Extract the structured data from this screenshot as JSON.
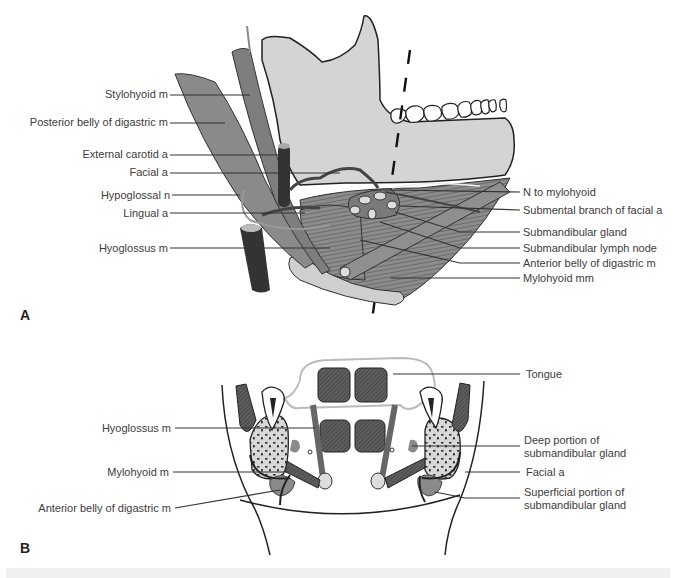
{
  "figure": {
    "panels": [
      {
        "id": "A",
        "letter": "A",
        "view": "lateral view of submandibular region",
        "labels_left": [
          {
            "text": "Stylohyoid m"
          },
          {
            "text": "Posterior belly of digastric m"
          },
          {
            "text": "External carotid a"
          },
          {
            "text": "Facial a"
          },
          {
            "text": "Hypoglossal n"
          },
          {
            "text": "Lingual a"
          },
          {
            "text": "Hyoglossus m"
          }
        ],
        "labels_right": [
          {
            "text": "N to mylohyoid"
          },
          {
            "text": "Submental branch of facial a"
          },
          {
            "text": "Submandibular gland"
          },
          {
            "text": "Submandibular lymph node"
          },
          {
            "text": "Anterior belly of digastric m"
          },
          {
            "text": "Mylohyoid mm"
          }
        ]
      },
      {
        "id": "B",
        "letter": "B",
        "view": "coronal section through floor of mouth",
        "labels_left": [
          {
            "text": "Hyoglossus m"
          },
          {
            "text": "Mylohyoid m"
          },
          {
            "text": "Anterior belly of digastric m"
          }
        ],
        "labels_right": [
          {
            "text": "Tongue"
          },
          {
            "text": "Deep portion of"
          },
          {
            "text": "submandibular gland"
          },
          {
            "text": "Facial a"
          },
          {
            "text": "Superficial portion of"
          },
          {
            "text": "submandibular gland"
          }
        ]
      }
    ],
    "colors": {
      "bone": "#d6d6d6",
      "muscle": "#8a8a8a",
      "muscle_dark": "#6e6e6e",
      "vessel": "#3a3a3a",
      "gland": "#9a9a9a",
      "tongue_muscle": "#5a5a5a",
      "leader": "#333333"
    }
  }
}
